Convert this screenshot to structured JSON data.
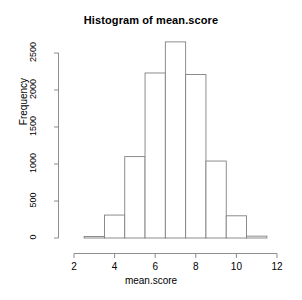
{
  "chart_data": {
    "type": "bar",
    "title": "Histogram of mean.score",
    "xlabel": "mean.score",
    "ylabel": "Frequency",
    "grid": false,
    "legend": null,
    "xlim": [
      2,
      12
    ],
    "ylim": [
      0,
      2700
    ],
    "bin_width": 1,
    "bin_edges": [
      2.5,
      3.5,
      4.5,
      5.5,
      6.5,
      7.5,
      8.5,
      9.5,
      10.5,
      11.5
    ],
    "categories": [
      "2.5-3.5",
      "3.5-4.5",
      "4.5-5.5",
      "5.5-6.5",
      "6.5-7.5",
      "7.5-8.5",
      "8.5-9.5",
      "9.5-10.5",
      "10.5-11.5"
    ],
    "values": [
      20,
      310,
      1100,
      2230,
      2650,
      2210,
      1040,
      300,
      25
    ],
    "xticks": [
      2,
      4,
      6,
      8,
      10,
      12
    ],
    "xtick_labels": [
      "2",
      "4",
      "6",
      "8",
      "10",
      "12"
    ],
    "yticks": [
      0,
      500,
      1000,
      1500,
      2000,
      2500
    ],
    "ytick_labels": [
      "0",
      "500",
      "1000",
      "1500",
      "2000",
      "2500"
    ],
    "bar_fill": "#ffffff",
    "bar_stroke": "#808080",
    "axis_color": "#808080",
    "text_color": "#000000"
  }
}
